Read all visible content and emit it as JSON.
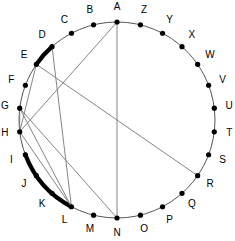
{
  "figure": {
    "geometry": {
      "center_x": 117,
      "center_y": 120,
      "radius": 98,
      "label_radius": 113,
      "start_angle_deg": -90,
      "direction": "clockwise"
    },
    "colors": {
      "circle_stroke": "#555555",
      "chord_stroke": "#777777",
      "arc_highlight": "#000000",
      "dot_fill": "#000000",
      "label_fill": "#000000",
      "background": "#ffffff"
    },
    "vertices": [
      {
        "id": "A",
        "label": "A",
        "index": 0
      },
      {
        "id": "B",
        "label": "B",
        "index": 1
      },
      {
        "id": "C",
        "label": "C",
        "index": 2
      },
      {
        "id": "D",
        "label": "D",
        "index": 3
      },
      {
        "id": "E",
        "label": "E",
        "index": 4
      },
      {
        "id": "F",
        "label": "F",
        "index": 5
      },
      {
        "id": "G",
        "label": "G",
        "index": 6
      },
      {
        "id": "H",
        "label": "H",
        "index": 7
      },
      {
        "id": "I",
        "label": "I",
        "index": 8
      },
      {
        "id": "J",
        "label": "J",
        "index": 9
      },
      {
        "id": "K",
        "label": "K",
        "index": 10
      },
      {
        "id": "L",
        "label": "L",
        "index": 11
      },
      {
        "id": "M",
        "label": "M",
        "index": 12
      },
      {
        "id": "N",
        "label": "N",
        "index": 13
      },
      {
        "id": "O",
        "label": "O",
        "index": 14
      },
      {
        "id": "P",
        "label": "P",
        "index": 15
      },
      {
        "id": "Q",
        "label": "Q",
        "index": 16
      },
      {
        "id": "R",
        "label": "R",
        "index": 17
      },
      {
        "id": "S",
        "label": "S",
        "index": 18
      },
      {
        "id": "T",
        "label": "T",
        "index": 19
      },
      {
        "id": "U",
        "label": "U",
        "index": 20
      },
      {
        "id": "V",
        "label": "V",
        "index": 21
      },
      {
        "id": "W",
        "label": "W",
        "index": 22
      },
      {
        "id": "X",
        "label": "X",
        "index": 23
      },
      {
        "id": "Y",
        "label": "Y",
        "index": 24
      },
      {
        "id": "Z",
        "label": "Z",
        "index": 25
      }
    ],
    "vertex_order_note": "A at top, labels proceed counterclockwise B,C,D... down the left side; Z,Y,X... down the right side",
    "label_sequence_counterclockwise": [
      "A",
      "B",
      "C",
      "D",
      "E",
      "F",
      "G",
      "H",
      "I",
      "J",
      "K",
      "L",
      "M",
      "N",
      "O",
      "P",
      "Q",
      "R",
      "S",
      "T",
      "U",
      "V",
      "W",
      "X",
      "Y",
      "Z"
    ],
    "chords": [
      {
        "from": "A",
        "to": "N"
      },
      {
        "from": "A",
        "to": "H"
      },
      {
        "from": "D",
        "to": "L"
      },
      {
        "from": "E",
        "to": "R"
      },
      {
        "from": "E",
        "to": "H"
      },
      {
        "from": "G",
        "to": "H"
      },
      {
        "from": "G",
        "to": "L"
      },
      {
        "from": "G",
        "to": "N"
      },
      {
        "from": "H",
        "to": "L"
      }
    ],
    "highlighted_arcs": [
      {
        "from": "D",
        "to": "E",
        "style": "thick"
      },
      {
        "from": "I",
        "to": "L",
        "style": "thick"
      }
    ]
  }
}
